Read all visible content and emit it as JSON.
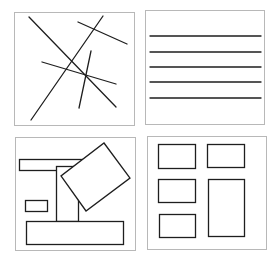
{
  "figure": {
    "colors": {
      "stroke": "#1e1e1e",
      "frame": "#b8b8b8",
      "background": "#ffffff"
    },
    "panels": [
      {
        "id": "intersecting-lines",
        "frame": {
          "x": 14,
          "y": 12,
          "w": 120,
          "h": 113
        },
        "lines": [
          {
            "x1": 29,
            "y1": 17,
            "x2": 116,
            "y2": 107
          },
          {
            "x1": 103,
            "y1": 16,
            "x2": 31,
            "y2": 120
          },
          {
            "x1": 78,
            "y1": 22,
            "x2": 127,
            "y2": 44
          },
          {
            "x1": 42,
            "y1": 62,
            "x2": 116,
            "y2": 84
          },
          {
            "x1": 91,
            "y1": 51,
            "x2": 79,
            "y2": 108
          }
        ]
      },
      {
        "id": "parallel-lines",
        "frame": {
          "x": 145,
          "y": 10,
          "w": 119,
          "h": 114
        },
        "lines": [
          {
            "x1": 150,
            "y1": 36,
            "x2": 261,
            "y2": 36
          },
          {
            "x1": 150,
            "y1": 52,
            "x2": 261,
            "y2": 52
          },
          {
            "x1": 150,
            "y1": 67,
            "x2": 261,
            "y2": 67
          },
          {
            "x1": 150,
            "y1": 82,
            "x2": 261,
            "y2": 82
          },
          {
            "x1": 150,
            "y1": 98,
            "x2": 261,
            "y2": 98
          }
        ]
      },
      {
        "id": "overlapping-shapes",
        "frame": {
          "x": 15,
          "y": 137,
          "w": 120,
          "h": 113
        },
        "rects": [
          {
            "name": "top-bar",
            "x": 19,
            "y": 159,
            "w": 64,
            "h": 11
          },
          {
            "name": "column",
            "x": 56,
            "y": 166,
            "w": 22,
            "h": 55
          },
          {
            "name": "small-box",
            "x": 25,
            "y": 200,
            "w": 22,
            "h": 11
          },
          {
            "name": "bottom-bar",
            "x": 26,
            "y": 221,
            "w": 97,
            "h": 23
          }
        ],
        "polygons": [
          {
            "name": "tilted-box",
            "points": "104,143 130,178 86,211 61,176"
          }
        ]
      },
      {
        "id": "grid-layout",
        "frame": {
          "x": 147,
          "y": 136,
          "w": 119,
          "h": 113
        },
        "rects": [
          {
            "name": "box-1",
            "x": 158,
            "y": 144,
            "w": 37,
            "h": 24
          },
          {
            "name": "box-2",
            "x": 207,
            "y": 144,
            "w": 37,
            "h": 23
          },
          {
            "name": "box-3",
            "x": 158,
            "y": 179,
            "w": 37,
            "h": 23
          },
          {
            "name": "box-4-tall",
            "x": 208,
            "y": 179,
            "w": 36,
            "h": 57
          },
          {
            "name": "box-5",
            "x": 159,
            "y": 214,
            "w": 36,
            "h": 23
          }
        ]
      }
    ]
  }
}
